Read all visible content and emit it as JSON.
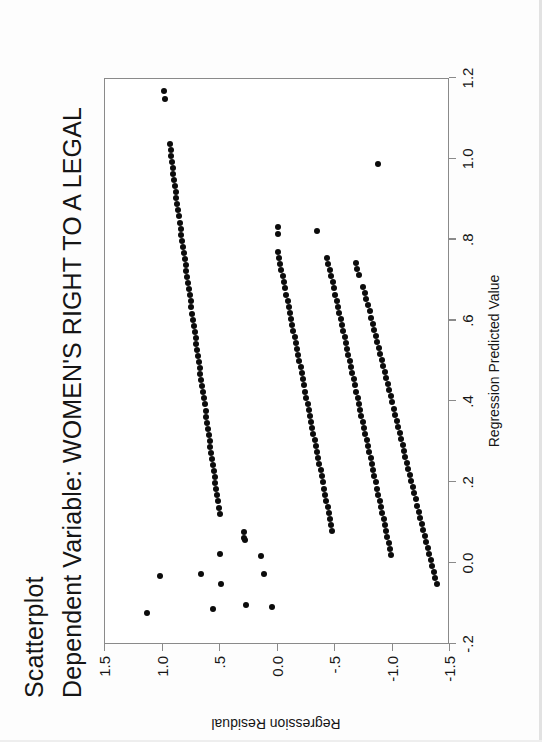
{
  "document": {
    "kind": "spss-chart-output",
    "orientation_note": "landscape figure rotated 90 degrees counter-clockwise on the page"
  },
  "titles": {
    "main": "Scatterplot",
    "sub": "Dependent Variable: WOMEN'S RIGHT TO A LEGAL"
  },
  "axes": {
    "x": {
      "title": "Regression Predicted Value",
      "ticks": [
        "-.2",
        "0.0",
        ".2",
        ".4",
        ".6",
        ".8",
        "1.0",
        "1.2"
      ],
      "values": [
        -0.2,
        0.0,
        0.2,
        0.4,
        0.6,
        0.8,
        1.0,
        1.2
      ],
      "min": -0.2,
      "max": 1.2
    },
    "y": {
      "title": "Regression Residual",
      "ticks": [
        "-1.5",
        "-1.0",
        "-.5",
        "0.0",
        ".5",
        "1.0",
        "1.5"
      ],
      "values": [
        -1.5,
        -1.0,
        -0.5,
        0.0,
        0.5,
        1.0,
        1.5
      ],
      "min": -1.5,
      "max": 1.5
    }
  },
  "style": {
    "marker_color": "#0b0b0b",
    "frame_color": "#8a8a8a",
    "text_color": "#161616",
    "background": "#ffffff"
  },
  "chart_data": {
    "type": "scatter",
    "title": "Scatterplot",
    "subtitle": "Dependent Variable: WOMEN'S RIGHT TO A LEGAL",
    "xlabel": "Regression Predicted Value",
    "ylabel": "Regression Residual",
    "xlim": [
      -0.2,
      1.2
    ],
    "ylim": [
      -1.5,
      1.5
    ],
    "grid": false,
    "legend": false,
    "marker": "filled-circle",
    "series": [
      {
        "name": "band-1 (top / highest residual band)",
        "points": [
          [
            1.165,
            0.985
          ],
          [
            1.145,
            0.975
          ],
          [
            1.035,
            0.935
          ],
          [
            1.02,
            0.93
          ],
          [
            1.005,
            0.925
          ],
          [
            0.99,
            0.92
          ],
          [
            0.975,
            0.91
          ],
          [
            0.96,
            0.905
          ],
          [
            0.945,
            0.9
          ],
          [
            0.93,
            0.893
          ],
          [
            0.915,
            0.886
          ],
          [
            0.9,
            0.879
          ],
          [
            0.885,
            0.872
          ],
          [
            0.87,
            0.865
          ],
          [
            0.855,
            0.857
          ],
          [
            0.84,
            0.85
          ],
          [
            0.825,
            0.843
          ],
          [
            0.81,
            0.836
          ],
          [
            0.795,
            0.828
          ],
          [
            0.78,
            0.821
          ],
          [
            0.765,
            0.814
          ],
          [
            0.75,
            0.807
          ],
          [
            0.735,
            0.8
          ],
          [
            0.72,
            0.792
          ],
          [
            0.705,
            0.785
          ],
          [
            0.69,
            0.778
          ],
          [
            0.675,
            0.771
          ],
          [
            0.66,
            0.763
          ],
          [
            0.645,
            0.756
          ],
          [
            0.63,
            0.749
          ],
          [
            0.615,
            0.742
          ],
          [
            0.6,
            0.735
          ],
          [
            0.585,
            0.727
          ],
          [
            0.57,
            0.72
          ],
          [
            0.555,
            0.713
          ],
          [
            0.54,
            0.706
          ],
          [
            0.525,
            0.698
          ],
          [
            0.51,
            0.691
          ],
          [
            0.495,
            0.684
          ],
          [
            0.48,
            0.677
          ],
          [
            0.465,
            0.67
          ],
          [
            0.45,
            0.662
          ],
          [
            0.435,
            0.655
          ],
          [
            0.42,
            0.648
          ],
          [
            0.405,
            0.641
          ],
          [
            0.39,
            0.633
          ],
          [
            0.375,
            0.626
          ],
          [
            0.36,
            0.619
          ],
          [
            0.345,
            0.612
          ],
          [
            0.33,
            0.605
          ],
          [
            0.315,
            0.597
          ],
          [
            0.3,
            0.59
          ],
          [
            0.285,
            0.583
          ],
          [
            0.27,
            0.576
          ],
          [
            0.255,
            0.568
          ],
          [
            0.24,
            0.561
          ],
          [
            0.225,
            0.554
          ],
          [
            0.21,
            0.547
          ],
          [
            0.195,
            0.54
          ],
          [
            0.18,
            0.532
          ],
          [
            0.165,
            0.525
          ],
          [
            0.15,
            0.518
          ],
          [
            0.135,
            0.511
          ],
          [
            0.12,
            0.503
          ]
        ]
      },
      {
        "name": "band-2",
        "points": [
          [
            0.83,
            0.0
          ],
          [
            0.812,
            -0.008
          ],
          [
            0.768,
            0.0
          ],
          [
            0.752,
            -0.01
          ],
          [
            0.737,
            -0.022
          ],
          [
            0.722,
            -0.033
          ],
          [
            0.707,
            -0.045
          ],
          [
            0.692,
            -0.056
          ],
          [
            0.677,
            -0.066
          ],
          [
            0.662,
            -0.077
          ],
          [
            0.647,
            -0.087
          ],
          [
            0.632,
            -0.098
          ],
          [
            0.617,
            -0.108
          ],
          [
            0.602,
            -0.118
          ],
          [
            0.587,
            -0.128
          ],
          [
            0.572,
            -0.139
          ],
          [
            0.557,
            -0.149
          ],
          [
            0.542,
            -0.159
          ],
          [
            0.527,
            -0.169
          ],
          [
            0.512,
            -0.18
          ],
          [
            0.497,
            -0.19
          ],
          [
            0.482,
            -0.2
          ],
          [
            0.467,
            -0.21
          ],
          [
            0.452,
            -0.22
          ],
          [
            0.437,
            -0.231
          ],
          [
            0.422,
            -0.241
          ],
          [
            0.407,
            -0.251
          ],
          [
            0.392,
            -0.261
          ],
          [
            0.377,
            -0.272
          ],
          [
            0.362,
            -0.282
          ],
          [
            0.347,
            -0.292
          ],
          [
            0.332,
            -0.302
          ],
          [
            0.317,
            -0.313
          ],
          [
            0.302,
            -0.323
          ],
          [
            0.287,
            -0.333
          ],
          [
            0.272,
            -0.343
          ],
          [
            0.257,
            -0.353
          ],
          [
            0.242,
            -0.364
          ],
          [
            0.227,
            -0.374
          ],
          [
            0.212,
            -0.384
          ],
          [
            0.197,
            -0.394
          ],
          [
            0.182,
            -0.405
          ],
          [
            0.167,
            -0.415
          ],
          [
            0.152,
            -0.425
          ],
          [
            0.137,
            -0.435
          ],
          [
            0.122,
            -0.446
          ],
          [
            0.107,
            -0.456
          ],
          [
            0.092,
            -0.466
          ],
          [
            0.077,
            -0.476
          ]
        ]
      },
      {
        "name": "band-3",
        "points": [
          [
            0.82,
            -0.345
          ],
          [
            0.752,
            -0.43
          ],
          [
            0.737,
            -0.442
          ],
          [
            0.722,
            -0.455
          ],
          [
            0.707,
            -0.468
          ],
          [
            0.692,
            -0.48
          ],
          [
            0.677,
            -0.492
          ],
          [
            0.662,
            -0.503
          ],
          [
            0.647,
            -0.515
          ],
          [
            0.632,
            -0.526
          ],
          [
            0.617,
            -0.538
          ],
          [
            0.602,
            -0.549
          ],
          [
            0.587,
            -0.56
          ],
          [
            0.572,
            -0.571
          ],
          [
            0.557,
            -0.583
          ],
          [
            0.542,
            -0.594
          ],
          [
            0.527,
            -0.605
          ],
          [
            0.512,
            -0.617
          ],
          [
            0.497,
            -0.628
          ],
          [
            0.482,
            -0.639
          ],
          [
            0.467,
            -0.65
          ],
          [
            0.452,
            -0.662
          ],
          [
            0.437,
            -0.673
          ],
          [
            0.422,
            -0.684
          ],
          [
            0.407,
            -0.696
          ],
          [
            0.392,
            -0.707
          ],
          [
            0.377,
            -0.718
          ],
          [
            0.362,
            -0.73
          ],
          [
            0.347,
            -0.741
          ],
          [
            0.332,
            -0.752
          ],
          [
            0.317,
            -0.764
          ],
          [
            0.302,
            -0.775
          ],
          [
            0.287,
            -0.786
          ],
          [
            0.272,
            -0.798
          ],
          [
            0.257,
            -0.809
          ],
          [
            0.242,
            -0.82
          ],
          [
            0.227,
            -0.832
          ],
          [
            0.212,
            -0.843
          ],
          [
            0.197,
            -0.854
          ],
          [
            0.182,
            -0.866
          ],
          [
            0.167,
            -0.877
          ],
          [
            0.152,
            -0.888
          ],
          [
            0.137,
            -0.9
          ],
          [
            0.122,
            -0.911
          ],
          [
            0.107,
            -0.922
          ],
          [
            0.092,
            -0.934
          ],
          [
            0.077,
            -0.945
          ],
          [
            0.062,
            -0.956
          ],
          [
            0.047,
            -0.968
          ],
          [
            0.032,
            -0.979
          ],
          [
            0.017,
            -0.99
          ]
        ]
      },
      {
        "name": "band-4 (bottom / lowest residual band)",
        "points": [
          [
            0.74,
            -0.68
          ],
          [
            0.725,
            -0.695
          ],
          [
            0.71,
            -0.71
          ],
          [
            0.68,
            -0.742
          ],
          [
            0.665,
            -0.758
          ],
          [
            0.65,
            -0.772
          ],
          [
            0.635,
            -0.786
          ],
          [
            0.62,
            -0.8
          ],
          [
            0.605,
            -0.813
          ],
          [
            0.59,
            -0.827
          ],
          [
            0.575,
            -0.84
          ],
          [
            0.56,
            -0.853
          ],
          [
            0.545,
            -0.866
          ],
          [
            0.53,
            -0.879
          ],
          [
            0.515,
            -0.892
          ],
          [
            0.5,
            -0.905
          ],
          [
            0.485,
            -0.918
          ],
          [
            0.47,
            -0.931
          ],
          [
            0.455,
            -0.944
          ],
          [
            0.44,
            -0.957
          ],
          [
            0.425,
            -0.97
          ],
          [
            0.41,
            -0.983
          ],
          [
            0.395,
            -0.996
          ],
          [
            0.38,
            -1.009
          ],
          [
            0.365,
            -1.022
          ],
          [
            0.35,
            -1.035
          ],
          [
            0.335,
            -1.048
          ],
          [
            0.32,
            -1.061
          ],
          [
            0.305,
            -1.074
          ],
          [
            0.29,
            -1.087
          ],
          [
            0.275,
            -1.1
          ],
          [
            0.26,
            -1.113
          ],
          [
            0.245,
            -1.126
          ],
          [
            0.23,
            -1.139
          ],
          [
            0.215,
            -1.152
          ],
          [
            0.2,
            -1.165
          ],
          [
            0.185,
            -1.178
          ],
          [
            0.17,
            -1.191
          ],
          [
            0.155,
            -1.204
          ],
          [
            0.14,
            -1.217
          ],
          [
            0.125,
            -1.23
          ],
          [
            0.11,
            -1.243
          ],
          [
            0.095,
            -1.256
          ],
          [
            0.08,
            -1.269
          ],
          [
            0.065,
            -1.282
          ],
          [
            0.05,
            -1.295
          ],
          [
            0.035,
            -1.308
          ],
          [
            0.02,
            -1.321
          ],
          [
            0.005,
            -1.334
          ],
          [
            -0.01,
            -1.347
          ],
          [
            -0.025,
            -1.36
          ],
          [
            -0.04,
            -1.373
          ],
          [
            -0.055,
            -1.386
          ]
        ]
      },
      {
        "name": "outliers",
        "points": [
          [
            -0.125,
            1.135
          ],
          [
            -0.035,
            1.02
          ],
          [
            -0.03,
            0.665
          ],
          [
            -0.115,
            0.56
          ],
          [
            -0.055,
            0.49
          ],
          [
            0.02,
            0.5
          ],
          [
            -0.105,
            0.275
          ],
          [
            0.015,
            0.145
          ],
          [
            -0.03,
            0.115
          ],
          [
            -0.11,
            0.05
          ],
          [
            0.055,
            0.28
          ],
          [
            0.06,
            0.29
          ],
          [
            0.075,
            0.295
          ],
          [
            0.985,
            -0.875
          ]
        ]
      }
    ]
  }
}
